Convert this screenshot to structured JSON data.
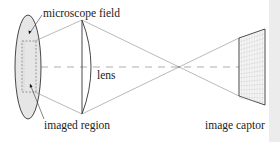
{
  "diagram": {
    "type": "optical imaging schematic",
    "labels": {
      "microscope_field": "microscope field",
      "lens": "lens",
      "imaged_region": "imaged region",
      "image_captor": "image captor"
    },
    "elements": [
      {
        "id": "microscope-field",
        "shape": "ellipse",
        "fill": "#e6e6e6"
      },
      {
        "id": "imaged-region",
        "shape": "dashed rectangle inside ellipse"
      },
      {
        "id": "lens",
        "shape": "plano-convex lens"
      },
      {
        "id": "optical-axis",
        "shape": "dashed horizontal line"
      },
      {
        "id": "focal-point",
        "shape": "ray crossing point"
      },
      {
        "id": "image-captor",
        "shape": "gridded quadrilateral sensor"
      }
    ],
    "colors": {
      "line": "#333333",
      "ray": "#8a8a8a",
      "field_fill": "#e6e6e6",
      "strip": "#ececec"
    }
  }
}
